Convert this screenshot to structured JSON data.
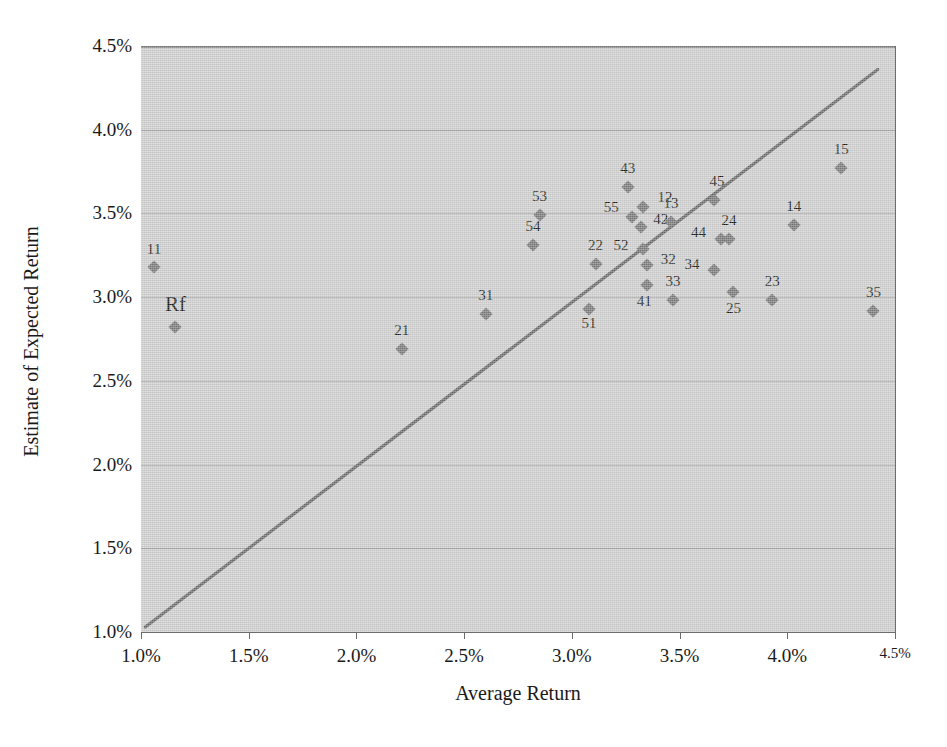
{
  "chart_data": {
    "type": "scatter",
    "title": "",
    "xlabel": "Average Return",
    "ylabel": "Estimate of Expected Return",
    "xlim": [
      1.0,
      4.5
    ],
    "ylim": [
      1.0,
      4.5
    ],
    "xticks": [
      "1.0%",
      "1.5%",
      "2.0%",
      "2.5%",
      "3.0%",
      "3.5%",
      "4.0%",
      "4.5%"
    ],
    "xtick_values": [
      1.0,
      1.5,
      2.0,
      2.5,
      3.0,
      3.5,
      4.0,
      4.5
    ],
    "yticks": [
      "1.0%",
      "1.5%",
      "2.0%",
      "2.5%",
      "3.0%",
      "3.5%",
      "4.0%",
      "4.5%"
    ],
    "ytick_values": [
      1.0,
      1.5,
      2.0,
      2.5,
      3.0,
      3.5,
      4.0,
      4.5
    ],
    "grid": true,
    "legend": "none",
    "plot_background": "#cfcfcf",
    "marker_color": "#7a7a7a",
    "line_color": "#6b6b6b",
    "reference_line": {
      "name": "45-degree line",
      "x0": 1.02,
      "y0": 1.03,
      "x1": 4.42,
      "y1": 4.36
    },
    "points": [
      {
        "label": "11",
        "x": 1.06,
        "y": 3.18,
        "label_dx": 0,
        "label_dy": -10
      },
      {
        "label": "Rf",
        "x": 1.16,
        "y": 2.82,
        "label_dx": 0,
        "label_dy": -12
      },
      {
        "label": "21",
        "x": 2.21,
        "y": 2.69,
        "label_dx": 0,
        "label_dy": -11
      },
      {
        "label": "31",
        "x": 2.6,
        "y": 2.9,
        "label_dx": 0,
        "label_dy": -11
      },
      {
        "label": "54",
        "x": 2.82,
        "y": 3.31,
        "label_dx": 0,
        "label_dy": -11
      },
      {
        "label": "53",
        "x": 2.85,
        "y": 3.49,
        "label_dx": 0,
        "label_dy": -11
      },
      {
        "label": "51",
        "x": 3.08,
        "y": 2.93,
        "label_dx": 0,
        "label_dy": 22
      },
      {
        "label": "22",
        "x": 3.11,
        "y": 3.2,
        "label_dx": 0,
        "label_dy": -11
      },
      {
        "label": "43",
        "x": 3.26,
        "y": 3.66,
        "label_dx": 0,
        "label_dy": -11
      },
      {
        "label": "55",
        "x": 3.28,
        "y": 3.48,
        "label_dx": -21,
        "label_dy": -2
      },
      {
        "label": "42",
        "x": 3.32,
        "y": 3.42,
        "label_dx": 20,
        "label_dy": 0
      },
      {
        "label": "12",
        "x": 3.33,
        "y": 3.54,
        "label_dx": 22,
        "label_dy": -2
      },
      {
        "label": "52",
        "x": 3.33,
        "y": 3.29,
        "label_dx": -22,
        "label_dy": 4
      },
      {
        "label": "32",
        "x": 3.35,
        "y": 3.19,
        "label_dx": 21,
        "label_dy": 2
      },
      {
        "label": "41",
        "x": 3.35,
        "y": 3.07,
        "label_dx": -3,
        "label_dy": 24
      },
      {
        "label": "13",
        "x": 3.46,
        "y": 3.45,
        "label_dx": 0,
        "label_dy": -11
      },
      {
        "label": "33",
        "x": 3.47,
        "y": 2.98,
        "label_dx": 0,
        "label_dy": -11
      },
      {
        "label": "45",
        "x": 3.66,
        "y": 3.58,
        "label_dx": 3,
        "label_dy": -11
      },
      {
        "label": "34",
        "x": 3.66,
        "y": 3.16,
        "label_dx": -22,
        "label_dy": 2
      },
      {
        "label": "44",
        "x": 3.69,
        "y": 3.35,
        "label_dx": -22,
        "label_dy": 1
      },
      {
        "label": "24",
        "x": 3.73,
        "y": 3.35,
        "label_dx": 0,
        "label_dy": -11
      },
      {
        "label": "25",
        "x": 3.75,
        "y": 3.03,
        "label_dx": 0,
        "label_dy": 24
      },
      {
        "label": "23",
        "x": 3.93,
        "y": 2.98,
        "label_dx": 0,
        "label_dy": -11
      },
      {
        "label": "14",
        "x": 4.03,
        "y": 3.43,
        "label_dx": 0,
        "label_dy": -11
      },
      {
        "label": "15",
        "x": 4.25,
        "y": 3.77,
        "label_dx": 0,
        "label_dy": -11
      },
      {
        "label": "35",
        "x": 4.4,
        "y": 2.92,
        "label_dx": 0,
        "label_dy": -11
      }
    ]
  }
}
